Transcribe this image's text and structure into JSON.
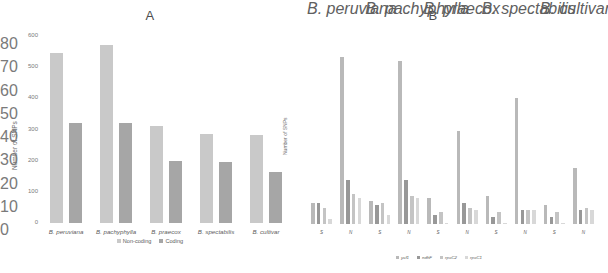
{
  "chart_data": [
    {
      "type": "bar",
      "panel": "A",
      "title": "A",
      "xlabel": "",
      "ylabel": "Number of SNPs",
      "ylim": [
        0,
        600
      ],
      "yticks": [
        0,
        100,
        200,
        300,
        400,
        500,
        600
      ],
      "ytick_labels": [
        "0",
        "100",
        "200",
        "300",
        "400",
        "500",
        "600"
      ],
      "grid": false,
      "legend_position": "bottom",
      "categories": [
        "B. peruviana",
        "B. pachyphylla",
        "B. praecox",
        "B. spectabilis",
        "B. cultivar"
      ],
      "series": [
        {
          "name": "Non-coding",
          "color": "#c9c9c9",
          "values": [
            545,
            570,
            312,
            285,
            283
          ]
        },
        {
          "name": "Coding",
          "color": "#a6a6a6",
          "values": [
            322,
            320,
            200,
            195,
            165
          ]
        }
      ]
    },
    {
      "type": "bar",
      "panel": "B",
      "title": "B",
      "xlabel": "",
      "ylabel": "Number of SNPs",
      "ylim": [
        0,
        80
      ],
      "yticks": [
        0,
        10,
        20,
        30,
        40,
        50,
        60,
        70,
        80
      ],
      "ytick_labels": [
        "0",
        "10",
        "20",
        "30",
        "40",
        "50",
        "60",
        "70",
        "80"
      ],
      "grid": false,
      "legend_position": "bottom",
      "categories": [
        "B. peruviana",
        "B. pachyphylla",
        "B. praecox",
        "B. spectabilis",
        "B. cultivar"
      ],
      "subgroups": [
        "S",
        "N"
      ],
      "series": [
        {
          "name": "ycf1",
          "color": "#b9b9b9",
          "values": [
            9,
            72,
            10,
            70,
            11,
            40,
            12,
            54,
            8,
            24
          ]
        },
        {
          "name": "ndhF",
          "color": "#989898",
          "values": [
            9,
            19,
            8,
            19,
            4,
            9,
            3,
            6,
            3,
            6
          ]
        },
        {
          "name": "rpoC2",
          "color": "#c4c4c4",
          "values": [
            7,
            13,
            9,
            12,
            5,
            7,
            5,
            6,
            5,
            7
          ]
        },
        {
          "name": "rpoC1",
          "color": "#d8d8d8",
          "values": [
            2,
            11,
            4,
            11,
            0.4,
            6,
            0.4,
            6,
            0.4,
            6
          ]
        }
      ]
    }
  ],
  "panelA": {
    "letter": "A",
    "ylabel": "Number of SNPs",
    "yticks": [
      "600",
      "500",
      "400",
      "300",
      "200",
      "100",
      "0"
    ],
    "categories": [
      "B. peruviana",
      "B. pachyphylla",
      "B. praecox",
      "B. spectabilis",
      "B. cultivar"
    ],
    "legend": [
      {
        "label": "Non-coding"
      },
      {
        "label": "Coding"
      }
    ]
  },
  "panelB": {
    "letter": "B",
    "ylabel": "Number of SNPs",
    "yticks": [
      "80",
      "70",
      "60",
      "50",
      "40",
      "30",
      "20",
      "10",
      "0"
    ],
    "categories": [
      "B. peruviana",
      "B. pachyphylla",
      "B. praecox",
      "B. spectabilis",
      "B. cultivar"
    ],
    "subgroups": [
      "S",
      "N",
      "S",
      "N",
      "S",
      "N",
      "S",
      "N",
      "S",
      "N"
    ],
    "legend": [
      {
        "label": "ycf1"
      },
      {
        "label": "ndhF"
      },
      {
        "label": "rpoC2"
      },
      {
        "label": "rpoC1"
      }
    ]
  }
}
